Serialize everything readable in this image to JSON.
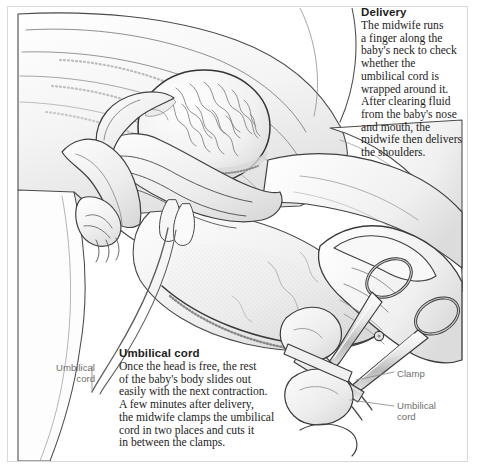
{
  "page": {
    "width": 479,
    "height": 470,
    "background": "#ffffff",
    "border_color": "#d9d9d9",
    "ink_color": "#1d1d1d",
    "label_color": "#6f6f6f",
    "leader_color": "#8d8d8d",
    "shade_light": "#f2f2f2",
    "shade_mid": "#e0e0e0",
    "shade_dark": "#bdbdbd"
  },
  "callouts": {
    "delivery": {
      "heading": "Delivery",
      "body": "The midwife runs\na finger along the\nbaby's neck to check\nwhether the\numbilical cord is\nwrapped around it.\nAfter clearing fluid\nfrom the baby's nose\nand mouth, the\nmidwife then delivers\nthe shoulders."
    },
    "umbilical_cord": {
      "heading": "Umbilical cord",
      "body": "Once the head is free, the rest\nof the baby's body slides out\neasily with the next contraction.\nA few minutes after delivery,\nthe midwife clamps the umbilical\ncord in two places and cuts it\nin between the clamps."
    }
  },
  "labels": {
    "cord_left": "Umbilical\ncord",
    "clamp": "Clamp",
    "cord_right": "Umbilical\ncord"
  },
  "illustration": {
    "main_scene": "birth-delivery-scene",
    "inset_scene": "cord-clamping-scissors-inset",
    "elements": [
      "mother-thigh",
      "mother-abdomen",
      "baby-head-crowning",
      "midwife-hand-supporting-head",
      "baby-arm",
      "umbilical-cord",
      "gloved-hand",
      "surgical-scissors",
      "umbilical-clamp"
    ]
  }
}
